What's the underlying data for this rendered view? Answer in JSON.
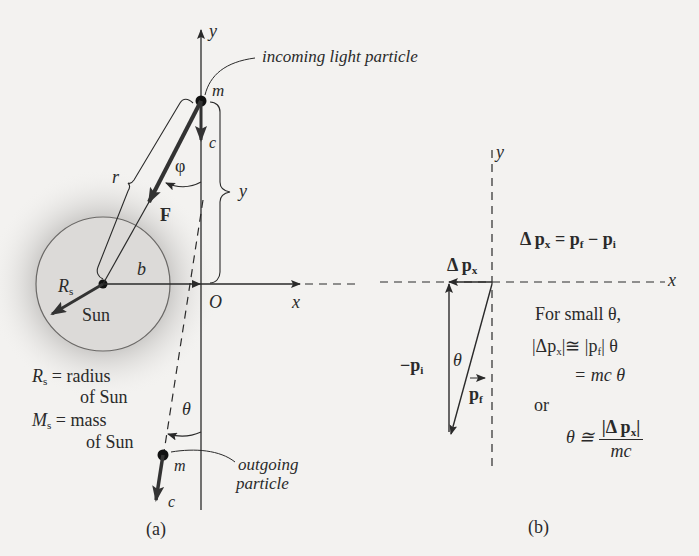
{
  "figure": {
    "panel_a": {
      "caption": "(a)",
      "axis_y_label": "y",
      "axis_x_label": "x",
      "origin_label": "O",
      "incoming_label": "incoming light particle",
      "outgoing_label_line1": "outgoing",
      "outgoing_label_line2": "particle",
      "mass_label": "m",
      "mass_label_out": "m",
      "speed_label": "c",
      "speed_label_out": "c",
      "phi_label": "φ",
      "r_label": "r",
      "y_bracket_label": "y",
      "force_label": "F",
      "b_label": "b",
      "Rs_label": "R",
      "Rs_sub": "s",
      "sun_label": "Sun",
      "theta_label": "θ",
      "legend_rs_sym": "R",
      "legend_rs_sub": "s",
      "legend_rs_line1": "= radius",
      "legend_rs_line2": "of Sun",
      "legend_ms_sym": "M",
      "legend_ms_sub": "s",
      "legend_ms_line1": "= mass",
      "legend_ms_line2": "of Sun"
    },
    "panel_b": {
      "caption": "(b)",
      "axis_y_label": "y",
      "axis_x_label": "x",
      "delta_px_label": "Δ p",
      "delta_px_sub": "x",
      "neg_pi_label": "−p",
      "neg_pi_sub": "i",
      "pf_label": "p",
      "pf_sub": "f",
      "theta_label": "θ",
      "eq1_lhs": "Δ p",
      "eq1_lhs_sub": "x",
      "eq1_rhs": "= p",
      "eq1_rhs_sub1": "f",
      "eq1_rhs_mid": " − p",
      "eq1_rhs_sub2": "i",
      "small_theta_text": "For small θ,",
      "eq2_part1": "|Δp",
      "eq2_sub1": "x",
      "eq2_part2": "|≅ |p",
      "eq2_sub2": "f",
      "eq2_part3": "| θ",
      "eq3": "= mc θ",
      "or_text": "or",
      "eq4_lhs": "θ ≅",
      "eq4_num": "|Δ p",
      "eq4_num_sub": "x",
      "eq4_num_end": "|",
      "eq4_den": "mc"
    },
    "colors": {
      "background": "#f3f2f0",
      "ink": "#2a2a2a",
      "sun_fill": "#dcdad8",
      "sun_glow": "#9a9896"
    }
  }
}
